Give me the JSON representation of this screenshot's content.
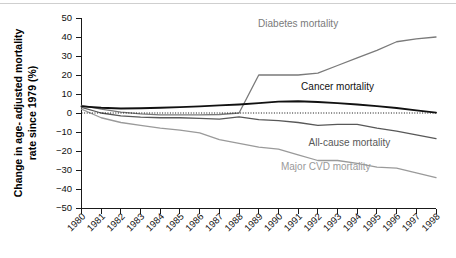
{
  "chart_data": {
    "type": "line",
    "title": "",
    "xlabel": "",
    "ylabel": "Change in age- adjusted mortality rate since 1979 (%)",
    "ylabel_line1": "Change in age- adjusted mortality",
    "ylabel_line2": "rate since 1979 (%)",
    "x": [
      1980,
      1981,
      1982,
      1983,
      1984,
      1985,
      1986,
      1987,
      1988,
      1989,
      1990,
      1991,
      1992,
      1993,
      1994,
      1995,
      1996,
      1997,
      1998
    ],
    "categories": [
      "1980",
      "1981",
      "1982",
      "1983",
      "1984",
      "1985",
      "1986",
      "1987",
      "1988",
      "1989",
      "1990",
      "1991",
      "1992",
      "1993",
      "1994",
      "1995",
      "1996",
      "1997",
      "1998"
    ],
    "xlim": [
      1980,
      1998
    ],
    "ylim": [
      -50,
      50
    ],
    "yticks": [
      50,
      40,
      30,
      20,
      10,
      0,
      -10,
      -20,
      -30,
      -40,
      -50
    ],
    "ytick_labels": [
      "50",
      "40",
      "30",
      "20",
      "10",
      "0",
      "−10",
      "−20",
      "−30",
      "−40",
      "−50"
    ],
    "grid": false,
    "legend_position": "inline-annotations",
    "zero_reference_line": 0,
    "series": [
      {
        "name": "Diabetes mortality",
        "color": "#7a7a7a",
        "width": 1.3,
        "label_x": 1991.0,
        "label_y": 45.5,
        "label_anchor": "middle",
        "values": [
          4.0,
          2.0,
          0.5,
          -0.5,
          -1.0,
          -1.0,
          -1.0,
          -0.8,
          0.0,
          20.0,
          20.0,
          20.0,
          21.0,
          25.0,
          29.0,
          33.0,
          37.5,
          39.0,
          40.0
        ]
      },
      {
        "name": "Cancer mortality",
        "color": "#111111",
        "width": 1.9,
        "label_x": 1993.0,
        "label_y": 12.0,
        "label_anchor": "middle",
        "values": [
          3.5,
          2.8,
          2.4,
          2.5,
          2.8,
          3.1,
          3.5,
          4.0,
          4.5,
          5.2,
          6.0,
          6.2,
          5.8,
          5.2,
          4.5,
          3.6,
          2.6,
          1.4,
          0.2
        ]
      },
      {
        "name": "All-cause mortality",
        "color": "#585858",
        "width": 1.3,
        "label_x": 1993.6,
        "label_y": -17.5,
        "label_anchor": "middle",
        "values": [
          3.0,
          0.0,
          -1.5,
          -2.2,
          -2.5,
          -2.5,
          -2.8,
          -3.2,
          -2.0,
          -3.5,
          -4.0,
          -5.0,
          -6.5,
          -6.0,
          -6.0,
          -8.0,
          -9.5,
          -11.5,
          -13.5
        ]
      },
      {
        "name": "Major CVD mortality",
        "color": "#9a9a9a",
        "width": 1.3,
        "label_x": 1992.4,
        "label_y": -30.0,
        "label_anchor": "middle",
        "values": [
          2.0,
          -2.5,
          -5.0,
          -6.5,
          -8.0,
          -9.0,
          -10.5,
          -14.0,
          -16.0,
          -18.0,
          -19.0,
          -22.0,
          -25.0,
          -25.0,
          -26.5,
          -28.5,
          -29.0,
          -31.5,
          -34.0
        ]
      }
    ]
  }
}
